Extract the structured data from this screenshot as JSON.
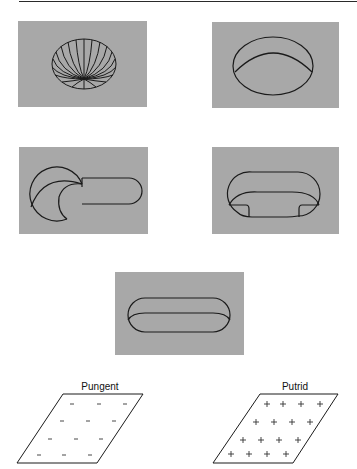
{
  "figure": {
    "panels": [
      {
        "id": "panel-1",
        "shape": "sphere-meridians",
        "description": "Ellipsoid drawn with meridian lines converging near bottom"
      },
      {
        "id": "panel-2",
        "shape": "dish",
        "description": "Shallow oval dish / open bowl"
      },
      {
        "id": "panel-3",
        "shape": "wrench-head",
        "description": "Circular head with handle (wrench-like form)"
      },
      {
        "id": "panel-4",
        "shape": "rounded-tray",
        "description": "Rounded oval tray with notched inner contour"
      },
      {
        "id": "panel-5",
        "shape": "capsule-trough",
        "description": "Elongated capsule-shaped trough"
      }
    ],
    "panel_color": "#a8a8a8",
    "line_color": "#1a1a1a"
  },
  "planes": [
    {
      "label": "Pungent",
      "symbol": "–",
      "rows": [
        3,
        3,
        3,
        3
      ]
    },
    {
      "label": "Putrid",
      "symbol": "+",
      "rows": [
        4,
        4,
        4,
        4
      ]
    }
  ]
}
